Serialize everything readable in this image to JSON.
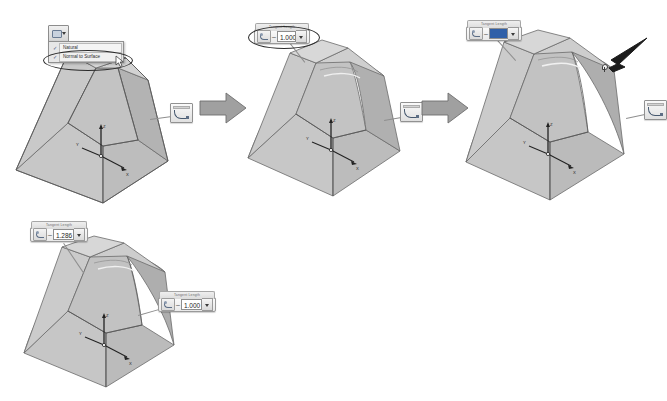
{
  "figure": {
    "application": "SolidWorks 3D CAD",
    "background_color": "#ffffff"
  },
  "colors": {
    "face_light": "#d2d2d2",
    "face_mid": "#bfbfbf",
    "face_dark": "#a8a8a8",
    "face_top": "#cccccc",
    "edge": "#6b6b6b",
    "arrow_fill": "#9e9e9e",
    "arrow_stroke": "#6e6e6e",
    "highlight_ellipse": "#2a2a2a",
    "selection_blue": "#2f5fa8",
    "axis_black": "#262626"
  },
  "stages": [
    {
      "id": "stage-1",
      "name": "natural-tangency",
      "label": "Stage 1 — start/end tangency dropdown open",
      "shape": "straight-tapered-loft",
      "menu": {
        "name": "tangency-type-menu",
        "items": [
          {
            "label": "Natural",
            "checked": true
          },
          {
            "label": "Normal to Surface",
            "checked": false,
            "highlighted": true
          }
        ]
      },
      "toolbar_button": {
        "name": "tangency-dropdown-button",
        "label": ""
      },
      "callout_icon": {
        "name": "curvature-display-icon",
        "label": ""
      },
      "triad": {
        "x": "X",
        "y": "Y",
        "z": "Z"
      }
    },
    {
      "id": "stage-2",
      "name": "tangency-magnitude-1",
      "label": "Stage 2 — tangent length 1.000",
      "shape": "slightly-curved-loft",
      "spinbox": {
        "name": "tangent-length-spinbox",
        "caption": "Tangent Length",
        "value": "1.000",
        "selected": false,
        "highlighted": true
      },
      "callout_icon": {
        "name": "curvature-display-icon",
        "label": ""
      },
      "triad": {
        "x": "X",
        "y": "Y",
        "z": "Z"
      }
    },
    {
      "id": "stage-3",
      "name": "tangency-dragged",
      "label": "Stage 3 — value field selected while dragging handle",
      "shape": "strongly-curved-loft",
      "spinbox": {
        "name": "tangent-length-spinbox",
        "caption": "Tangent Length",
        "value": "",
        "selected": true,
        "highlighted": false
      },
      "callout_icon": {
        "name": "curvature-display-icon",
        "label": ""
      },
      "pointer": {
        "name": "mouse-pointer-arrow",
        "label": ""
      },
      "drag_handle": {
        "name": "tangency-drag-handle",
        "label": ""
      },
      "triad": {
        "x": "X",
        "y": "Y",
        "z": "Z"
      }
    },
    {
      "id": "stage-4",
      "name": "tangency-result",
      "label": "Stage 4 — resulting tangent lengths 1.286 and 1.000",
      "shape": "curved-loft-result",
      "spinbox_top": {
        "name": "tangent-length-spinbox-top",
        "caption": "Tangent Length",
        "value": "1.286",
        "selected": false,
        "highlighted": false
      },
      "spinbox_side": {
        "name": "tangent-length-spinbox-side",
        "caption": "Tangent Length",
        "value": "1.000",
        "selected": false,
        "highlighted": false
      },
      "triad": {
        "x": "X",
        "y": "Y",
        "z": "Z"
      }
    }
  ],
  "flow_arrows": [
    {
      "name": "flow-arrow-1",
      "direction": "right"
    },
    {
      "name": "flow-arrow-2",
      "direction": "right"
    }
  ]
}
